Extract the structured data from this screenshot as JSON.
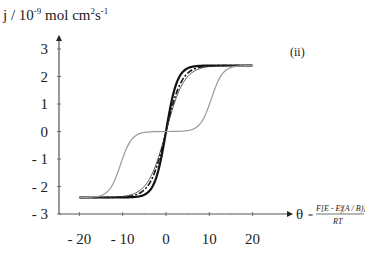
{
  "chart_data": {
    "type": "line",
    "title": "",
    "panel_label": "(ii)",
    "ylabel": "j / 10^-9 mol cm^2 s^-1",
    "ylabel_parts": {
      "base": "j / 10",
      "exp1": "-9",
      "mid": " mol cm",
      "exp2": "2",
      "s": "s",
      "exp3": "-1"
    },
    "xlabel": "θ = F[E - E'f(A/B)] / RT",
    "xlabel_parts": {
      "theta": "θ",
      "eq": "=",
      "numerator": "F[E - E",
      "sup": "o",
      "sub": "f",
      "num_tail": "(A / B)]",
      "denominator": "RT"
    },
    "xlim": [
      -25,
      25
    ],
    "ylim": [
      -3,
      3
    ],
    "x_ticks": [
      -20,
      -10,
      0,
      10,
      20
    ],
    "x_tick_labels": [
      "- 20",
      "- 10",
      "0",
      "10",
      "20"
    ],
    "y_ticks": [
      3,
      2,
      1,
      0,
      -1,
      -2,
      -3
    ],
    "y_tick_labels": [
      "3",
      "2",
      "1",
      "0",
      "- 1",
      "- 2",
      "- 3"
    ],
    "grid": false,
    "legend": null,
    "series": [
      {
        "name": "solid black (steep)",
        "color": "#111111",
        "style": "solid",
        "width": 2.2,
        "x": [
          -20,
          -10,
          -6,
          -4,
          -2,
          -1,
          0,
          1,
          2,
          4,
          6,
          10,
          20
        ],
        "y": [
          -2.4,
          -2.4,
          -2.38,
          -2.3,
          -1.8,
          -1.0,
          0,
          1.0,
          1.8,
          2.3,
          2.38,
          2.4,
          2.4
        ]
      },
      {
        "name": "dashed black",
        "color": "#111111",
        "style": "dashed",
        "width": 1.6,
        "x": [
          -20,
          -10,
          -6,
          -4,
          -2,
          0,
          2,
          4,
          6,
          10,
          20
        ],
        "y": [
          -2.4,
          -2.35,
          -2.2,
          -1.9,
          -1.2,
          0,
          1.2,
          1.9,
          2.2,
          2.35,
          2.4
        ]
      },
      {
        "name": "thin black",
        "color": "#333333",
        "style": "solid",
        "width": 0.8,
        "x": [
          -20,
          -10,
          -6,
          -4,
          -2,
          0,
          2,
          4,
          6,
          10,
          20
        ],
        "y": [
          -2.4,
          -2.3,
          -2.1,
          -1.8,
          -1.1,
          0,
          1.1,
          1.8,
          2.1,
          2.3,
          2.4
        ]
      },
      {
        "name": "grey (two-step)",
        "color": "#9a9a9a",
        "style": "solid",
        "width": 1.2,
        "x": [
          -20,
          -16,
          -13,
          -11,
          -8,
          -5,
          0,
          5,
          8,
          11,
          13,
          16,
          20
        ],
        "y": [
          -2.4,
          -2.1,
          -1.6,
          -1.2,
          -0.4,
          -0.1,
          0,
          0.1,
          0.4,
          1.2,
          1.6,
          2.1,
          2.4
        ]
      }
    ]
  }
}
